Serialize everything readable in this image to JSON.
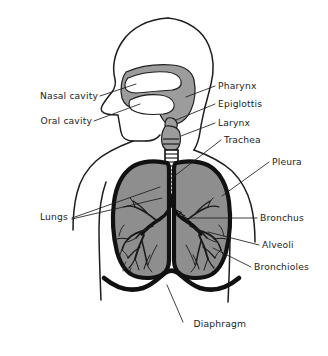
{
  "diagram": {
    "view": "sagittal head profile with anterior thorax",
    "background_color": "#ffffff",
    "ink_color": "#1d1d1d",
    "organ_fill_color": "#8e8e8e",
    "cavity_fill_color": "#9c9c9c",
    "outline_color": "#111111"
  },
  "labels": {
    "left": [
      {
        "id": "nasal-cavity",
        "text": "Nasal cavity",
        "x": 98,
        "y": 99
      },
      {
        "id": "oral-cavity",
        "text": "Oral cavity",
        "x": 92,
        "y": 124
      },
      {
        "id": "lungs",
        "text": "Lungs",
        "x": 68,
        "y": 220
      }
    ],
    "right": [
      {
        "id": "pharynx",
        "text": "Pharynx",
        "x": 218,
        "y": 89
      },
      {
        "id": "epiglottis",
        "text": "Epiglottis",
        "x": 218,
        "y": 107
      },
      {
        "id": "larynx",
        "text": "Larynx",
        "x": 218,
        "y": 126
      },
      {
        "id": "trachea",
        "text": "Trachea",
        "x": 224,
        "y": 143
      },
      {
        "id": "pleura",
        "text": "Pleura",
        "x": 272,
        "y": 165
      },
      {
        "id": "bronchus",
        "text": "Bronchus",
        "x": 260,
        "y": 221
      },
      {
        "id": "alveoli",
        "text": "Alveoli",
        "x": 262,
        "y": 248
      },
      {
        "id": "bronchioles",
        "text": "Bronchioles",
        "x": 254,
        "y": 270
      }
    ],
    "bottom": [
      {
        "id": "diaphragm",
        "text": "Diaphragm",
        "x": 190,
        "y": 327
      }
    ]
  },
  "structures": [
    {
      "id": "head-profile",
      "name": "head-profile"
    },
    {
      "id": "nasal-cavity-shape",
      "name": "nasal-cavity"
    },
    {
      "id": "oral-cavity-shape",
      "name": "oral-cavity"
    },
    {
      "id": "pharynx-shape",
      "name": "pharynx"
    },
    {
      "id": "epiglottis-shape",
      "name": "epiglottis"
    },
    {
      "id": "larynx-shape",
      "name": "larynx"
    },
    {
      "id": "trachea-shape",
      "name": "trachea"
    },
    {
      "id": "left-lung",
      "name": "left-lung"
    },
    {
      "id": "right-lung",
      "name": "right-lung"
    },
    {
      "id": "bronchial-tree",
      "name": "bronchial-tree"
    },
    {
      "id": "diaphragm-shape",
      "name": "diaphragm"
    },
    {
      "id": "torso-outline",
      "name": "torso-outline"
    }
  ]
}
